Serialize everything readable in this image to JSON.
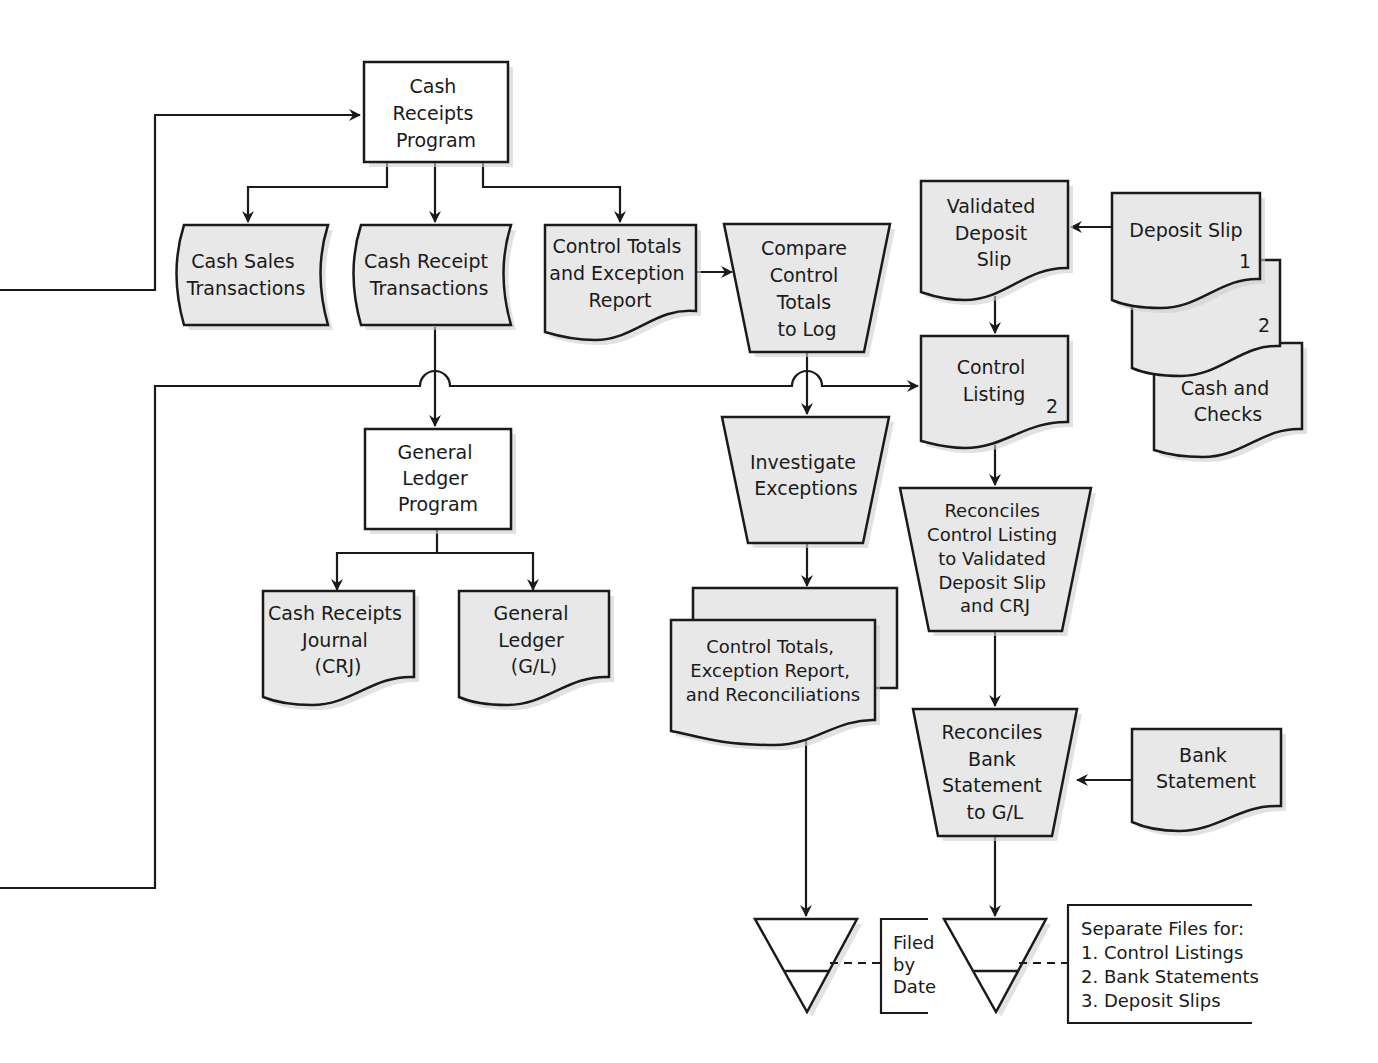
{
  "diagram": {
    "type": "flowchart",
    "nodes": {
      "cash_receipts_program": {
        "shape": "process",
        "lines": [
          "Cash",
          "Receipts",
          "Program"
        ]
      },
      "cash_sales_transactions": {
        "shape": "stored-data",
        "lines": [
          "Cash Sales",
          "Transactions"
        ]
      },
      "cash_receipt_transactions": {
        "shape": "stored-data",
        "lines": [
          "Cash Receipt",
          "Transactions"
        ]
      },
      "control_totals_exception_report": {
        "shape": "document",
        "lines": [
          "Control Totals",
          "and Exception",
          "Report"
        ]
      },
      "compare_control_totals": {
        "shape": "manual-operation",
        "lines": [
          "Compare",
          "Control",
          "Totals",
          "to Log"
        ]
      },
      "validated_deposit_slip": {
        "shape": "document",
        "lines": [
          "Validated",
          "Deposit",
          "Slip"
        ]
      },
      "deposit_slip": {
        "shape": "multi-document",
        "lines": [
          "Deposit Slip"
        ],
        "copy1": "1",
        "copy2": "2"
      },
      "cash_and_checks": {
        "shape": "document",
        "lines": [
          "Cash and",
          "Checks"
        ]
      },
      "control_listing": {
        "shape": "document",
        "lines": [
          "Control",
          "Listing"
        ],
        "copy": "2"
      },
      "general_ledger_program": {
        "shape": "process",
        "lines": [
          "General",
          "Ledger",
          "Program"
        ]
      },
      "investigate_exceptions": {
        "shape": "manual-operation",
        "lines": [
          "Investigate",
          "Exceptions"
        ]
      },
      "reconciles_control_listing": {
        "shape": "manual-operation",
        "lines": [
          "Reconciles",
          "Control Listing",
          "to Validated",
          "Deposit Slip",
          "and CRJ"
        ]
      },
      "cash_receipts_journal": {
        "shape": "document",
        "lines": [
          "Cash Receipts",
          "Journal",
          "(CRJ)"
        ]
      },
      "general_ledger": {
        "shape": "document",
        "lines": [
          "General",
          "Ledger",
          "(G/L)"
        ]
      },
      "control_totals_exception_reconciliations": {
        "shape": "multi-document",
        "lines": [
          "Control Totals,",
          "Exception Report,",
          "and Reconciliations"
        ]
      },
      "reconciles_bank_statement": {
        "shape": "manual-operation",
        "lines": [
          "Reconciles",
          "Bank",
          "Statement",
          "to G/L"
        ]
      },
      "bank_statement": {
        "shape": "document",
        "lines": [
          "Bank",
          "Statement"
        ]
      },
      "file_by_date": {
        "shape": "offline-storage"
      },
      "file_separate": {
        "shape": "offline-storage"
      }
    },
    "annotations": {
      "filed_by_date": [
        "Filed",
        "by",
        "Date"
      ],
      "separate_files": [
        "Separate Files for:",
        "1. Control Listings",
        "2. Bank Statements",
        "3. Deposit Slips"
      ]
    },
    "edges": [
      [
        "off-page-left-top",
        "cash_receipts_program"
      ],
      [
        "cash_receipts_program",
        "cash_sales_transactions"
      ],
      [
        "cash_receipts_program",
        "cash_receipt_transactions"
      ],
      [
        "cash_receipts_program",
        "control_totals_exception_report"
      ],
      [
        "control_totals_exception_report",
        "compare_control_totals"
      ],
      [
        "cash_receipt_transactions",
        "general_ledger_program"
      ],
      [
        "compare_control_totals",
        "investigate_exceptions"
      ],
      [
        "off-page-left-bottom",
        "control_listing"
      ],
      [
        "deposit_slip",
        "validated_deposit_slip"
      ],
      [
        "validated_deposit_slip",
        "control_listing"
      ],
      [
        "control_listing",
        "reconciles_control_listing"
      ],
      [
        "general_ledger_program",
        "cash_receipts_journal"
      ],
      [
        "general_ledger_program",
        "general_ledger"
      ],
      [
        "investigate_exceptions",
        "control_totals_exception_reconciliations"
      ],
      [
        "reconciles_control_listing",
        "reconciles_bank_statement"
      ],
      [
        "bank_statement",
        "reconciles_bank_statement"
      ],
      [
        "control_totals_exception_reconciliations",
        "file_by_date"
      ],
      [
        "reconciles_bank_statement",
        "file_separate"
      ]
    ]
  }
}
